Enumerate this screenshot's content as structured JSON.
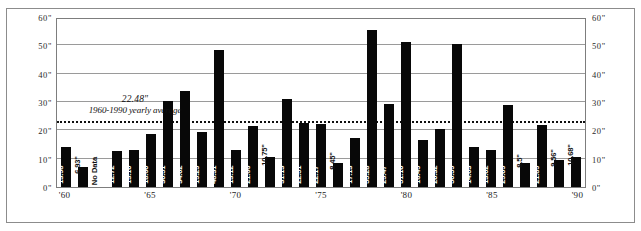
{
  "chart_data": {
    "type": "bar",
    "title": "",
    "xlabel": "",
    "ylabel": "",
    "ylim": [
      0,
      60
    ],
    "grid": true,
    "legend": "none",
    "unit": "\"",
    "y_ticks": [
      "0\"",
      "10\"",
      "20\"",
      "30\"",
      "40\"",
      "50\"",
      "60\""
    ],
    "y_tick_values": [
      0,
      10,
      20,
      30,
      40,
      50,
      60
    ],
    "x_tick_labels": [
      "'60",
      "'65",
      "'70",
      "'75",
      "'80",
      "'85",
      "'90"
    ],
    "x_tick_years": [
      1960,
      1965,
      1970,
      1975,
      1980,
      1985,
      1990
    ],
    "annotation": {
      "value": "22.48\"",
      "caption": "1960-1990 yearly average",
      "line_value": 22.48,
      "line_style": "dotted"
    },
    "categories": [
      1960,
      1961,
      1962,
      1963,
      1964,
      1965,
      1966,
      1967,
      1968,
      1969,
      1970,
      1971,
      1972,
      1973,
      1974,
      1975,
      1976,
      1977,
      1978,
      1979,
      1980,
      1981,
      1982,
      1983,
      1984,
      1985,
      1986,
      1987,
      1988,
      1989,
      1990
    ],
    "values": [
      13.98,
      6.93,
      null,
      12.72,
      13.1,
      18.6,
      30.51,
      34.02,
      19.29,
      48.31,
      13.12,
      21.66,
      10.75,
      31.13,
      22.51,
      22.17,
      8.45,
      17.13,
      55.28,
      29.47,
      51.1,
      16.49,
      20.32,
      50.59,
      14.03,
      13.02,
      29.09,
      8.5,
      21.89,
      9.56,
      10.68
    ],
    "bars": [
      {
        "year": 1960,
        "value": 13.98,
        "label": "13.98\""
      },
      {
        "year": 1961,
        "value": 6.93,
        "label": "6.93\""
      },
      {
        "year": 1962,
        "value": null,
        "label": "No Data"
      },
      {
        "year": 1963,
        "value": 12.72,
        "label": "12.72\""
      },
      {
        "year": 1964,
        "value": 13.1,
        "label": "13.10\""
      },
      {
        "year": 1965,
        "value": 18.6,
        "label": "18.60\""
      },
      {
        "year": 1966,
        "value": 30.51,
        "label": "30.51\""
      },
      {
        "year": 1967,
        "value": 34.02,
        "label": "34.02\""
      },
      {
        "year": 1968,
        "value": 19.29,
        "label": "19.29\""
      },
      {
        "year": 1969,
        "value": 48.31,
        "label": "48.31\""
      },
      {
        "year": 1970,
        "value": 13.12,
        "label": "13.12\""
      },
      {
        "year": 1971,
        "value": 21.66,
        "label": "21.66\""
      },
      {
        "year": 1972,
        "value": 10.75,
        "label": "10.75\""
      },
      {
        "year": 1973,
        "value": 31.13,
        "label": "31.13\""
      },
      {
        "year": 1974,
        "value": 22.51,
        "label": "22.51\""
      },
      {
        "year": 1975,
        "value": 22.17,
        "label": "22.17\""
      },
      {
        "year": 1976,
        "value": 8.45,
        "label": "8.45\""
      },
      {
        "year": 1977,
        "value": 17.13,
        "label": "17.13\""
      },
      {
        "year": 1978,
        "value": 55.28,
        "label": "55.28\""
      },
      {
        "year": 1979,
        "value": 29.47,
        "label": "29.47\""
      },
      {
        "year": 1980,
        "value": 51.1,
        "label": "51.10\""
      },
      {
        "year": 1981,
        "value": 16.49,
        "label": "16.49\""
      },
      {
        "year": 1982,
        "value": 20.32,
        "label": "20.32\""
      },
      {
        "year": 1983,
        "value": 50.59,
        "label": "50.59\""
      },
      {
        "year": 1984,
        "value": 14.03,
        "label": "14.03\""
      },
      {
        "year": 1985,
        "value": 13.02,
        "label": "13.02\""
      },
      {
        "year": 1986,
        "value": 29.09,
        "label": "29.09\""
      },
      {
        "year": 1987,
        "value": 8.5,
        "label": "8.5\""
      },
      {
        "year": 1988,
        "value": 21.89,
        "label": "21.89\""
      },
      {
        "year": 1989,
        "value": 9.56,
        "label": "9.56\""
      },
      {
        "year": 1990,
        "value": 10.68,
        "label": "10.68\""
      }
    ],
    "colors": {
      "bar": "#080808",
      "grid": "#9a9a9a",
      "axis": "#7d7d7d",
      "frame": "#8c8c8c",
      "average_line": "#111111",
      "background": "#ffffff",
      "bar_label_text": "#ffffff"
    }
  }
}
